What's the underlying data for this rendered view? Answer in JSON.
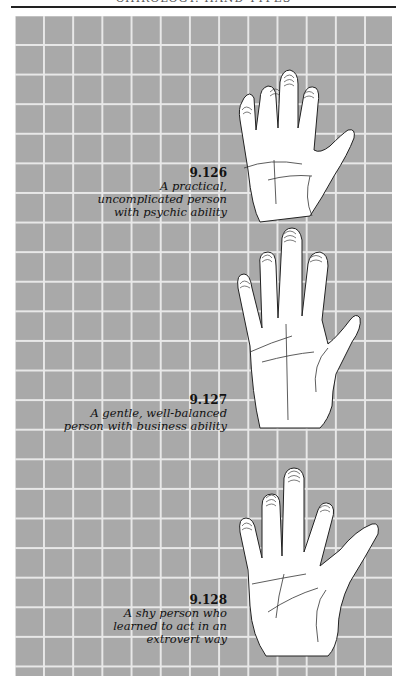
{
  "page": {
    "running_head": "CHIROLOGY: HAND TYPES",
    "background_color": "#a9a9a9",
    "grid_line_color": "#e8e8e8"
  },
  "figures": [
    {
      "number": "9.126",
      "caption": "A practical,\nuncomplicated person\nwith psychic ability"
    },
    {
      "number": "9.127",
      "caption": "A gentle, well-balanced\nperson with business ability"
    },
    {
      "number": "9.128",
      "caption": "A shy person who\nlearned to act in an\nextrovert way"
    }
  ]
}
